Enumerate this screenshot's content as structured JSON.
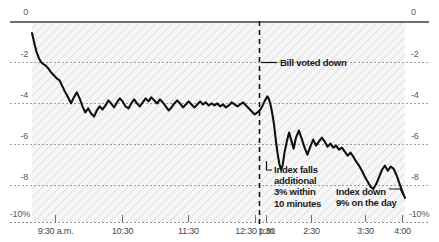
{
  "chart_data": {
    "type": "line",
    "title": "",
    "subtitle": "",
    "xlabel": "",
    "ylabel": "",
    "grid": true,
    "legend_position": "none",
    "ylim": [
      -10,
      0
    ],
    "xlim": [
      "9:30 a.m.",
      "4:00 p.m."
    ],
    "y_ticks": [
      "0",
      "-2",
      "-4",
      "-6",
      "-8",
      "-10%"
    ],
    "y_tick_values": [
      0,
      -2,
      -4,
      -6,
      -8,
      -10
    ],
    "y_ticks_right": [
      "0",
      "-2",
      "-4",
      "-6",
      "-8",
      "-10%"
    ],
    "x_ticks": [
      "9:30 a.m.",
      "10:30",
      "11:30",
      "12:30 p.m.",
      "1:30",
      "2:30",
      "3:30",
      "4:00"
    ],
    "x_tick_values": [
      9.5,
      10.5,
      11.5,
      12.5,
      13.5,
      14.5,
      15.5,
      16.0
    ],
    "series_name": "Index % change on the day",
    "units": "percent",
    "x": [
      9.5,
      9.54,
      9.58,
      9.62,
      9.66,
      9.7,
      9.74,
      9.78,
      9.83,
      9.88,
      9.93,
      9.98,
      10.03,
      10.08,
      10.13,
      10.18,
      10.23,
      10.28,
      10.33,
      10.38,
      10.43,
      10.48,
      10.53,
      10.58,
      10.63,
      10.68,
      10.73,
      10.78,
      10.83,
      10.88,
      10.93,
      10.98,
      11.03,
      11.08,
      11.13,
      11.18,
      11.23,
      11.28,
      11.33,
      11.38,
      11.43,
      11.48,
      11.53,
      11.58,
      11.63,
      11.68,
      11.73,
      11.78,
      11.83,
      11.88,
      11.93,
      11.98,
      12.03,
      12.08,
      12.13,
      12.18,
      12.23,
      12.28,
      12.33,
      12.38,
      12.43,
      12.48,
      12.53,
      12.58,
      12.63,
      12.68,
      12.73,
      12.78,
      12.83,
      12.88,
      12.93,
      12.98,
      13.03,
      13.08,
      13.13,
      13.18,
      13.23,
      13.28,
      13.33,
      13.38,
      13.43,
      13.48,
      13.52,
      13.56,
      13.6,
      13.63,
      13.66,
      13.69,
      13.72,
      13.75,
      13.78,
      13.81,
      13.84,
      13.87,
      13.9,
      13.94,
      13.98,
      14.02,
      14.06,
      14.1,
      14.15,
      14.2,
      14.25,
      14.3,
      14.35,
      14.4,
      14.45,
      14.5,
      14.55,
      14.6,
      14.65,
      14.7,
      14.75,
      14.8,
      14.85,
      14.9,
      14.95,
      15.0,
      15.05,
      15.1,
      15.15,
      15.2,
      15.25,
      15.3,
      15.35,
      15.4,
      15.45,
      15.5,
      15.55,
      15.6,
      15.65,
      15.7,
      15.75,
      15.8,
      15.85,
      15.9,
      15.95,
      16.0
    ],
    "y": [
      -0.6,
      -1.1,
      -1.55,
      -1.85,
      -2.05,
      -2.15,
      -2.22,
      -2.35,
      -2.55,
      -2.7,
      -2.85,
      -2.95,
      -3.25,
      -3.55,
      -3.8,
      -4.1,
      -3.8,
      -3.55,
      -3.85,
      -4.25,
      -4.55,
      -4.35,
      -4.6,
      -4.75,
      -4.45,
      -4.25,
      -4.4,
      -4.2,
      -3.95,
      -4.1,
      -4.3,
      -4.05,
      -3.85,
      -4.0,
      -4.25,
      -4.35,
      -4.1,
      -3.9,
      -4.1,
      -4.25,
      -4.05,
      -3.85,
      -4.0,
      -3.8,
      -3.95,
      -4.1,
      -3.9,
      -4.05,
      -4.25,
      -4.45,
      -4.3,
      -4.1,
      -3.95,
      -4.1,
      -4.3,
      -4.15,
      -4.0,
      -4.15,
      -4.3,
      -4.15,
      -4.0,
      -4.15,
      -4.05,
      -4.2,
      -4.1,
      -4.2,
      -4.1,
      -4.25,
      -4.15,
      -4.3,
      -4.2,
      -4.05,
      -4.15,
      -4.25,
      -4.15,
      -4.05,
      -4.2,
      -4.35,
      -4.5,
      -4.65,
      -4.55,
      -4.4,
      -4.2,
      -3.95,
      -3.75,
      -3.9,
      -4.2,
      -4.65,
      -5.2,
      -5.95,
      -6.6,
      -7.1,
      -7.4,
      -7.15,
      -6.55,
      -6.0,
      -5.55,
      -5.95,
      -6.35,
      -5.8,
      -5.45,
      -5.85,
      -6.3,
      -6.65,
      -6.25,
      -5.9,
      -6.2,
      -6.0,
      -5.8,
      -6.0,
      -6.25,
      -6.1,
      -6.3,
      -6.2,
      -6.4,
      -6.3,
      -6.5,
      -6.7,
      -6.55,
      -6.75,
      -7.0,
      -7.2,
      -7.45,
      -7.75,
      -8.0,
      -8.25,
      -8.35,
      -8.1,
      -7.75,
      -7.4,
      -7.2,
      -7.45,
      -7.25,
      -7.35,
      -7.65,
      -8.05,
      -8.45,
      -8.8,
      -9.0
    ],
    "annotations": [
      {
        "id": "bill-voted-down",
        "text": "Bill voted down",
        "at_x": 13.55,
        "at_y": -2.0
      },
      {
        "id": "index-falls",
        "lines": [
          "Index falls",
          "additional",
          "3% within",
          "10 minutes"
        ],
        "at_x": 13.62,
        "at_y": -7.4
      },
      {
        "id": "index-down-day",
        "lines": [
          "Index down",
          "9% on the day"
        ],
        "at_x": 16.0,
        "at_y": -9.0
      }
    ],
    "event_line": {
      "label": "Bill voted down",
      "x": 13.55,
      "style": "dashed"
    },
    "colors": {
      "line": "#111111",
      "axis": "#6b6f72",
      "grid": "#9aa0a4",
      "text": "#44484b",
      "plot_background": "#f4f4f4",
      "page_background": "#ffffff"
    }
  },
  "y_axis": {
    "ticks": [
      {
        "label": "0",
        "px": 21
      },
      {
        "label": "-2",
        "px": 62
      },
      {
        "label": "-4",
        "px": 103
      },
      {
        "label": "-6",
        "px": 144
      },
      {
        "label": "-8",
        "px": 185
      },
      {
        "label": "-10%",
        "px": 222
      }
    ]
  },
  "x_axis": {
    "ticks": [
      {
        "label": "9:30 a.m.",
        "px": 55
      },
      {
        "label": "10:30",
        "px": 122
      },
      {
        "label": "11:30",
        "px": 188
      },
      {
        "label": "12:30 p.m.",
        "px": 255
      },
      {
        "label": "1:30",
        "px": 266
      },
      {
        "label": "2:30",
        "px": 311
      },
      {
        "label": "3:30",
        "px": 365
      },
      {
        "label": "4:00",
        "px": 402
      }
    ]
  }
}
